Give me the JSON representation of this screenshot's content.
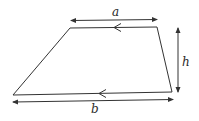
{
  "diagram": {
    "shape": "trapezium",
    "vertices": {
      "top_left": [
        70,
        28
      ],
      "top_right": [
        157,
        27
      ],
      "bottom_right": [
        172,
        92
      ],
      "bottom_left": [
        13,
        95
      ]
    },
    "labels": {
      "top_side": "a",
      "height": "h",
      "bottom_side": "b"
    },
    "parallel_markers": [
      "top-side-chevron",
      "bottom-side-chevron"
    ],
    "colors": {
      "line": "#333333",
      "background": "#ffffff"
    }
  }
}
